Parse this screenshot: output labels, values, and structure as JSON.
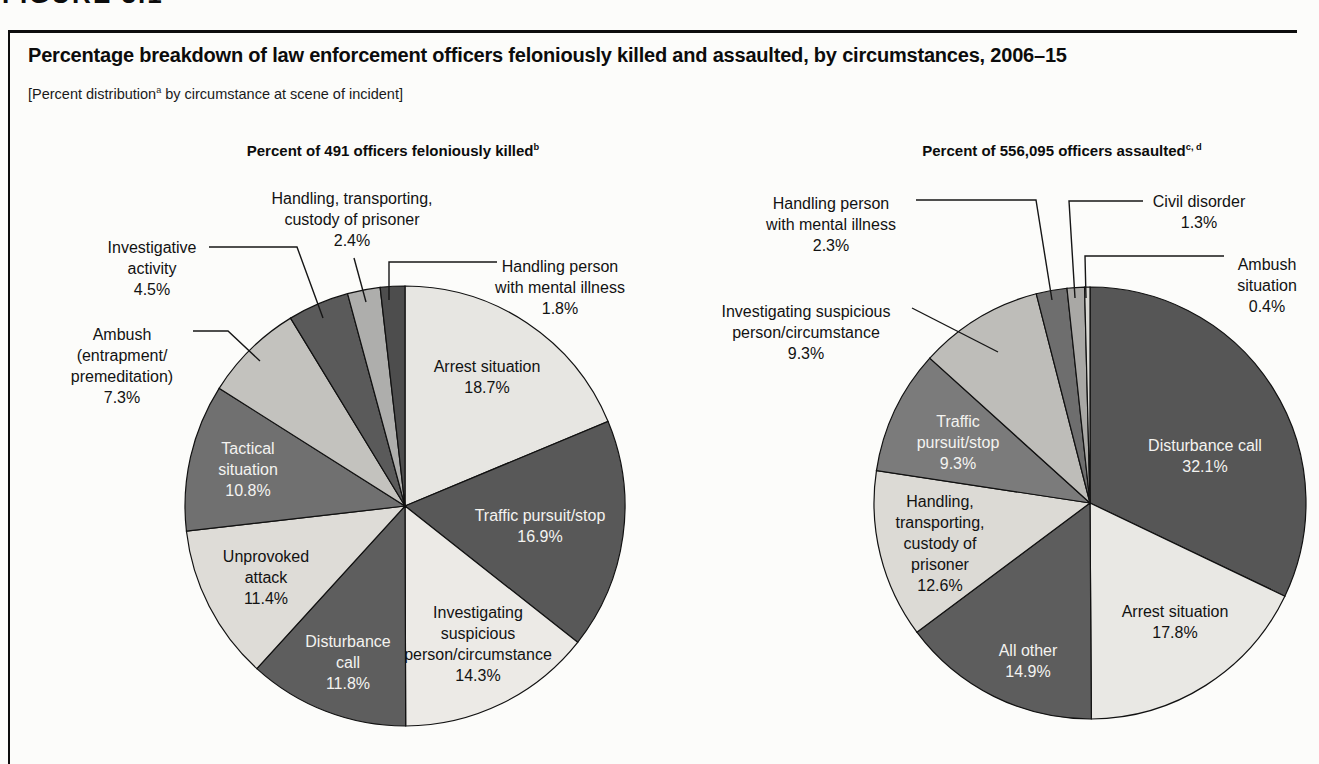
{
  "figure_fragment": "FIGURE 3.1",
  "header": {
    "title": "Percentage breakdown of law enforcement officers feloniously killed and assaulted, by circumstances, 2006–15",
    "subtitle_prefix": "[Percent distribution",
    "subtitle_sup": "a",
    "subtitle_suffix": " by circumstance at scene of incident]"
  },
  "chart_data": [
    {
      "type": "pie",
      "title": "Percent of 491 officers feloniously killed",
      "title_superscript": "b",
      "start_angle_deg": 0,
      "direction": "clockwise",
      "slices": [
        {
          "label": "Arrest situation",
          "label_lines": [
            "Arrest situation"
          ],
          "value": 18.7,
          "display": "18.7%",
          "color": "#e7e6e2",
          "text_color": "dark",
          "placement": "inside"
        },
        {
          "label": "Traffic pursuit/stop",
          "label_lines": [
            "Traffic pursuit/stop"
          ],
          "value": 16.9,
          "display": "16.9%",
          "color": "#585858",
          "text_color": "light",
          "placement": "inside"
        },
        {
          "label": "Investigating suspicious person/circumstance",
          "label_lines": [
            "Investigating",
            "suspicious",
            "person/circumstance"
          ],
          "value": 14.3,
          "display": "14.3%",
          "color": "#eceae6",
          "text_color": "dark",
          "placement": "inside"
        },
        {
          "label": "Disturbance call",
          "label_lines": [
            "Disturbance",
            "call"
          ],
          "value": 11.8,
          "display": "11.8%",
          "color": "#5e5e5e",
          "text_color": "light",
          "placement": "inside"
        },
        {
          "label": "Unprovoked attack",
          "label_lines": [
            "Unprovoked",
            "attack"
          ],
          "value": 11.4,
          "display": "11.4%",
          "color": "#dedcd7",
          "text_color": "dark",
          "placement": "inside"
        },
        {
          "label": "Tactical situation",
          "label_lines": [
            "Tactical",
            "situation"
          ],
          "value": 10.8,
          "display": "10.8%",
          "color": "#707070",
          "text_color": "light",
          "placement": "inside"
        },
        {
          "label": "Ambush (entrapment/premeditation)",
          "label_lines": [
            "Ambush",
            "(entrapment/",
            "premeditation)"
          ],
          "value": 7.3,
          "display": "7.3%",
          "color": "#c3c2be",
          "text_color": "dark",
          "placement": "outside"
        },
        {
          "label": "Investigative activity",
          "label_lines": [
            "Investigative",
            "activity"
          ],
          "value": 4.5,
          "display": "4.5%",
          "color": "#5a5a5a",
          "text_color": "dark",
          "placement": "outside"
        },
        {
          "label": "Handling, transporting, custody of prisoner",
          "label_lines": [
            "Handling, transporting,",
            "custody of prisoner"
          ],
          "value": 2.4,
          "display": "2.4%",
          "color": "#aeaeac",
          "text_color": "dark",
          "placement": "outside"
        },
        {
          "label": "Handling person with mental illness",
          "label_lines": [
            "Handling person",
            "with mental illness"
          ],
          "value": 1.8,
          "display": "1.8%",
          "color": "#4d4d4d",
          "text_color": "dark",
          "placement": "outside"
        }
      ]
    },
    {
      "type": "pie",
      "title": "Percent of 556,095 officers assaulted",
      "title_superscript": "c, d",
      "start_angle_deg": 0,
      "direction": "clockwise",
      "slices": [
        {
          "label": "Disturbance call",
          "label_lines": [
            "Disturbance call"
          ],
          "value": 32.1,
          "display": "32.1%",
          "color": "#565656",
          "text_color": "light",
          "placement": "inside"
        },
        {
          "label": "Arrest situation",
          "label_lines": [
            "Arrest situation"
          ],
          "value": 17.8,
          "display": "17.8%",
          "color": "#e9e8e4",
          "text_color": "dark",
          "placement": "inside"
        },
        {
          "label": "All other",
          "label_lines": [
            "All other"
          ],
          "value": 14.9,
          "display": "14.9%",
          "color": "#5d5d5d",
          "text_color": "light",
          "placement": "inside"
        },
        {
          "label": "Handling, transporting, custody of prisoner",
          "label_lines": [
            "Handling,",
            "transporting,",
            "custody of",
            "prisoner"
          ],
          "value": 12.6,
          "display": "12.6%",
          "color": "#dcdad5",
          "text_color": "dark",
          "placement": "inside"
        },
        {
          "label": "Traffic pursuit/stop",
          "label_lines": [
            "Traffic",
            "pursuit/stop"
          ],
          "value": 9.3,
          "display": "9.3%",
          "color": "#7b7b7b",
          "text_color": "light",
          "placement": "inside"
        },
        {
          "label": "Investigating suspicious person/circumstance",
          "label_lines": [
            "Investigating suspicious",
            "person/circumstance"
          ],
          "value": 9.3,
          "display": "9.3%",
          "color": "#bebdb9",
          "text_color": "dark",
          "placement": "outside"
        },
        {
          "label": "Handling person with mental illness",
          "label_lines": [
            "Handling person",
            "with mental illness"
          ],
          "value": 2.3,
          "display": "2.3%",
          "color": "#6e6e6e",
          "text_color": "dark",
          "placement": "outside"
        },
        {
          "label": "Civil disorder",
          "label_lines": [
            "Civil disorder"
          ],
          "value": 1.3,
          "display": "1.3%",
          "color": "#a9a8a5",
          "text_color": "dark",
          "placement": "outside"
        },
        {
          "label": "Ambush situation",
          "label_lines": [
            "Ambush",
            "situation"
          ],
          "value": 0.4,
          "display": "0.4%",
          "color": "#d9d8d3",
          "text_color": "dark",
          "placement": "outside"
        }
      ]
    }
  ]
}
